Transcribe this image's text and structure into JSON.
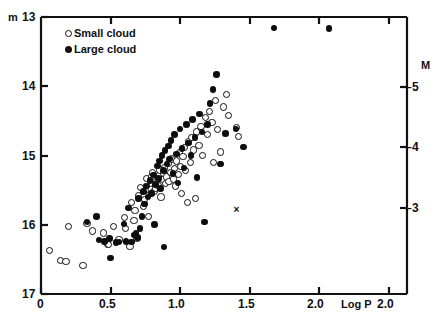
{
  "chart_data": {
    "type": "scatter",
    "title": "",
    "xlabel": "Log P",
    "ylabel": "m",
    "ylabel_right": "M",
    "xlim": [
      0,
      2.5
    ],
    "ylim": [
      17,
      13
    ],
    "ylim_right": [
      -2.55,
      -5.55
    ],
    "grid": false,
    "legend_position": "top-left",
    "x_ticks": [
      {
        "value": 0,
        "label": "0"
      },
      {
        "value": 0.5,
        "label": "0.5"
      },
      {
        "value": 1.0,
        "label": "1.0"
      },
      {
        "value": 1.5,
        "label": "1.5"
      },
      {
        "value": 2.0,
        "label": "2.0"
      },
      {
        "value": 2.5,
        "label": "2.0"
      }
    ],
    "y_ticks_left": [
      {
        "value": 13,
        "label": "13"
      },
      {
        "value": 14,
        "label": "14"
      },
      {
        "value": 15,
        "label": "15"
      },
      {
        "value": 16,
        "label": "16"
      },
      {
        "value": 17,
        "label": "17"
      }
    ],
    "y_ticks_right": [
      {
        "value": -5,
        "label": "5"
      },
      {
        "value": -4,
        "label": "4"
      },
      {
        "value": -3,
        "label": "3"
      }
    ],
    "axis_prefix_left": "m",
    "series": [
      {
        "name": "Small cloud",
        "marker": "open-circle",
        "color": "#0d0d0d",
        "points": [
          [
            0.063,
            16.37
          ],
          [
            0.139,
            16.52
          ],
          [
            0.18,
            16.53
          ],
          [
            0.302,
            16.59
          ],
          [
            0.196,
            16.02
          ],
          [
            0.33,
            15.98
          ],
          [
            0.368,
            16.09
          ],
          [
            0.448,
            16.12
          ],
          [
            0.477,
            16.28
          ],
          [
            0.487,
            16.29
          ],
          [
            0.52,
            16.03
          ],
          [
            0.56,
            16.22
          ],
          [
            0.6,
            15.9
          ],
          [
            0.606,
            16.05
          ],
          [
            0.64,
            16.31
          ],
          [
            0.652,
            15.68
          ],
          [
            0.668,
            15.94
          ],
          [
            0.675,
            15.8
          ],
          [
            0.69,
            16.2
          ],
          [
            0.7,
            15.58
          ],
          [
            0.712,
            15.46
          ],
          [
            0.735,
            15.74
          ],
          [
            0.742,
            15.63
          ],
          [
            0.752,
            15.5
          ],
          [
            0.76,
            15.33
          ],
          [
            0.77,
            15.88
          ],
          [
            0.788,
            15.4
          ],
          [
            0.795,
            15.3
          ],
          [
            0.8,
            15.24
          ],
          [
            0.812,
            15.52
          ],
          [
            0.82,
            15.47
          ],
          [
            0.828,
            15.37
          ],
          [
            0.84,
            15.43
          ],
          [
            0.848,
            15.29
          ],
          [
            0.855,
            15.21
          ],
          [
            0.862,
            15.6
          ],
          [
            0.87,
            15.35
          ],
          [
            0.88,
            15.26
          ],
          [
            0.888,
            15.18
          ],
          [
            0.895,
            15.41
          ],
          [
            0.902,
            15.31
          ],
          [
            0.915,
            15.12
          ],
          [
            0.92,
            15.38
          ],
          [
            0.93,
            15.25
          ],
          [
            0.94,
            15.05
          ],
          [
            0.95,
            15.34
          ],
          [
            0.958,
            15.19
          ],
          [
            0.968,
            15.44
          ],
          [
            0.975,
            15.08
          ],
          [
            0.985,
            15.27
          ],
          [
            0.995,
            14.96
          ],
          [
            1.005,
            15.16
          ],
          [
            1.012,
            15.55
          ],
          [
            1.02,
            15.02
          ],
          [
            1.03,
            14.88
          ],
          [
            1.04,
            15.22
          ],
          [
            1.05,
            15.68
          ],
          [
            1.06,
            14.8
          ],
          [
            1.072,
            15.1
          ],
          [
            1.085,
            14.74
          ],
          [
            1.098,
            14.92
          ],
          [
            1.11,
            15.62
          ],
          [
            1.12,
            14.66
          ],
          [
            1.135,
            14.85
          ],
          [
            1.15,
            14.58
          ],
          [
            1.162,
            15.0
          ],
          [
            1.18,
            14.45
          ],
          [
            1.195,
            14.7
          ],
          [
            1.21,
            14.37
          ],
          [
            1.228,
            14.52
          ],
          [
            1.24,
            15.1
          ],
          [
            1.255,
            14.2
          ],
          [
            1.27,
            14.63
          ],
          [
            1.29,
            14.95
          ],
          [
            1.31,
            14.3
          ],
          [
            1.33,
            14.12
          ],
          [
            1.345,
            14.42
          ],
          [
            1.405,
            14.6
          ],
          [
            1.42,
            14.72
          ]
        ]
      },
      {
        "name": "Large cloud",
        "marker": "filled-circle",
        "color": "#0d0d0d",
        "points": [
          [
            0.33,
            15.96
          ],
          [
            0.398,
            15.88
          ],
          [
            0.418,
            16.22
          ],
          [
            0.455,
            16.24
          ],
          [
            0.492,
            16.2
          ],
          [
            0.5,
            16.48
          ],
          [
            0.538,
            16.26
          ],
          [
            0.56,
            16.25
          ],
          [
            0.596,
            15.99
          ],
          [
            0.612,
            16.24
          ],
          [
            0.63,
            15.76
          ],
          [
            0.652,
            16.25
          ],
          [
            0.668,
            16.15
          ],
          [
            0.682,
            16.12
          ],
          [
            0.695,
            16.18
          ],
          [
            0.7,
            15.62
          ],
          [
            0.712,
            16.05
          ],
          [
            0.725,
            15.88
          ],
          [
            0.735,
            15.52
          ],
          [
            0.742,
            15.7
          ],
          [
            0.758,
            15.44
          ],
          [
            0.77,
            15.6
          ],
          [
            0.782,
            15.36
          ],
          [
            0.795,
            15.55
          ],
          [
            0.808,
            15.28
          ],
          [
            0.815,
            16.0
          ],
          [
            0.822,
            15.42
          ],
          [
            0.835,
            15.15
          ],
          [
            0.845,
            15.33
          ],
          [
            0.852,
            15.08
          ],
          [
            0.86,
            15.48
          ],
          [
            0.87,
            15.0
          ],
          [
            0.878,
            15.22
          ],
          [
            0.885,
            16.32
          ],
          [
            0.892,
            14.93
          ],
          [
            0.905,
            15.12
          ],
          [
            0.918,
            14.86
          ],
          [
            0.925,
            15.05
          ],
          [
            0.935,
            14.78
          ],
          [
            0.948,
            15.26
          ],
          [
            0.96,
            14.7
          ],
          [
            0.972,
            14.98
          ],
          [
            0.985,
            15.4
          ],
          [
            0.998,
            14.62
          ],
          [
            1.012,
            14.9
          ],
          [
            1.028,
            15.18
          ],
          [
            1.045,
            14.55
          ],
          [
            1.06,
            14.82
          ],
          [
            1.078,
            15.0
          ],
          [
            1.09,
            14.48
          ],
          [
            1.105,
            14.74
          ],
          [
            1.122,
            15.32
          ],
          [
            1.14,
            14.4
          ],
          [
            1.158,
            14.66
          ],
          [
            1.175,
            15.96
          ],
          [
            1.198,
            14.55
          ],
          [
            1.215,
            14.25
          ],
          [
            1.235,
            14.05
          ],
          [
            1.26,
            13.83
          ],
          [
            1.29,
            15.12
          ],
          [
            1.325,
            14.68
          ],
          [
            1.4,
            14.62
          ],
          [
            1.455,
            14.88
          ],
          [
            1.675,
            13.16
          ],
          [
            2.07,
            13.17
          ]
        ]
      },
      {
        "name": "outlier-cross",
        "marker": "cross",
        "color": "#0d0d0d",
        "points": [
          [
            1.405,
            15.78
          ]
        ]
      }
    ]
  },
  "legend": {
    "items": [
      {
        "label": "Small cloud",
        "marker": "open-circle"
      },
      {
        "label": "Large cloud",
        "marker": "filled-circle"
      }
    ]
  }
}
